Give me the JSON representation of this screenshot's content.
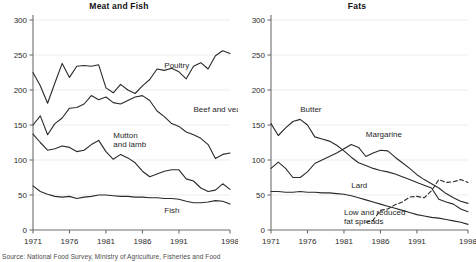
{
  "figure": {
    "source_note": "Source: National Food Survey, Ministry of Agriculture, Fisheries and Food",
    "background_color": "#ffffff",
    "line_color": "#2a2a2a",
    "grid_color": "#ededed",
    "axis_color": "#6e6e6e"
  },
  "panels": [
    {
      "id": "meat-and-fish",
      "title": "Meat and Fish",
      "series_labels": [
        "Poultry",
        "Beef and veal",
        "Mutton and lamb",
        "Fish"
      ]
    },
    {
      "id": "fats",
      "title": "Fats",
      "series_labels": [
        "Butter",
        "Margarine",
        "Lard",
        "Low and reduced fat spreads"
      ]
    }
  ],
  "axis": {
    "y_ticks": [
      "0",
      "50",
      "100",
      "150",
      "200",
      "250",
      "300"
    ],
    "x_ticks": [
      "1971",
      "1976",
      "1981",
      "1986",
      "1991",
      "1998"
    ],
    "ylim": [
      0,
      300
    ],
    "xlim": [
      1971,
      1998
    ]
  },
  "chart_data": [
    {
      "type": "line",
      "title": "Meat and Fish",
      "xlabel": "",
      "ylabel": "",
      "ylim": [
        0,
        300
      ],
      "xlim": [
        1971,
        1998
      ],
      "grid": true,
      "legend": "inline-annotations",
      "x": [
        1971,
        1972,
        1973,
        1974,
        1975,
        1976,
        1977,
        1978,
        1979,
        1980,
        1981,
        1982,
        1983,
        1984,
        1985,
        1986,
        1987,
        1988,
        1989,
        1990,
        1991,
        1992,
        1993,
        1994,
        1995,
        1996,
        1997,
        1998
      ],
      "series": [
        {
          "name": "Poultry",
          "label_position": {
            "x": 1989,
            "y": 232
          },
          "values": [
            225,
            206,
            181,
            210,
            238,
            218,
            234,
            235,
            234,
            236,
            203,
            196,
            208,
            200,
            195,
            206,
            215,
            230,
            228,
            231,
            226,
            216,
            234,
            239,
            230,
            249,
            256,
            252
          ]
        },
        {
          "name": "Beef and veal",
          "label_position": {
            "x": 1993,
            "y": 168
          },
          "values": [
            150,
            163,
            136,
            152,
            160,
            174,
            175,
            180,
            192,
            186,
            190,
            182,
            180,
            185,
            190,
            192,
            185,
            170,
            162,
            152,
            148,
            140,
            136,
            131,
            122,
            102,
            108,
            110
          ]
        },
        {
          "name": "Mutton and lamb",
          "label_position": {
            "x": 1982,
            "y": 132
          },
          "values": [
            137,
            125,
            114,
            116,
            120,
            118,
            112,
            114,
            122,
            128,
            112,
            101,
            108,
            103,
            96,
            84,
            76,
            80,
            84,
            86,
            86,
            73,
            70,
            60,
            55,
            57,
            66,
            58
          ]
        },
        {
          "name": "Fish",
          "label_position": {
            "x": 1989,
            "y": 24
          },
          "values": [
            63,
            55,
            51,
            48,
            47,
            48,
            45,
            47,
            48,
            50,
            50,
            49,
            48,
            48,
            47,
            47,
            46,
            46,
            45,
            45,
            44,
            41,
            39,
            39,
            40,
            42,
            41,
            37
          ]
        }
      ]
    },
    {
      "type": "line",
      "title": "Fats",
      "xlabel": "",
      "ylabel": "",
      "ylim": [
        0,
        300
      ],
      "xlim": [
        1971,
        1998
      ],
      "grid": true,
      "legend": "inline-annotations",
      "x": [
        1971,
        1972,
        1973,
        1974,
        1975,
        1976,
        1977,
        1978,
        1979,
        1980,
        1981,
        1982,
        1983,
        1984,
        1985,
        1986,
        1987,
        1988,
        1989,
        1990,
        1991,
        1992,
        1993,
        1994,
        1995,
        1996,
        1997,
        1998
      ],
      "series": [
        {
          "name": "Butter",
          "style": "solid",
          "label_position": {
            "x": 1975,
            "y": 168
          },
          "values": [
            152,
            135,
            146,
            155,
            158,
            150,
            133,
            130,
            127,
            121,
            113,
            104,
            96,
            92,
            88,
            85,
            83,
            80,
            76,
            72,
            68,
            64,
            60,
            44,
            40,
            37,
            30,
            26
          ]
        },
        {
          "name": "Margarine",
          "style": "solid",
          "label_position": {
            "x": 1984,
            "y": 133
          },
          "values": [
            88,
            97,
            88,
            75,
            75,
            83,
            95,
            100,
            105,
            110,
            116,
            122,
            118,
            105,
            110,
            114,
            113,
            104,
            96,
            88,
            79,
            72,
            66,
            60,
            52,
            46,
            41,
            38
          ]
        },
        {
          "name": "Lard",
          "style": "solid",
          "label_position": {
            "x": 1982,
            "y": 60
          },
          "values": [
            55,
            55,
            54,
            54,
            55,
            54,
            54,
            53,
            53,
            52,
            51,
            49,
            46,
            43,
            40,
            37,
            34,
            31,
            28,
            25,
            22,
            20,
            18,
            17,
            15,
            13,
            11,
            8
          ]
        },
        {
          "name": "Low and reduced fat spreads",
          "style": "dashed",
          "label_position": {
            "x": 1981,
            "y": 22
          },
          "start_year": 1984,
          "values": [
            null,
            null,
            null,
            null,
            null,
            null,
            null,
            null,
            null,
            null,
            null,
            null,
            null,
            11,
            14,
            28,
            30,
            36,
            40,
            47,
            48,
            46,
            56,
            72,
            68,
            69,
            72,
            68
          ]
        }
      ]
    }
  ]
}
